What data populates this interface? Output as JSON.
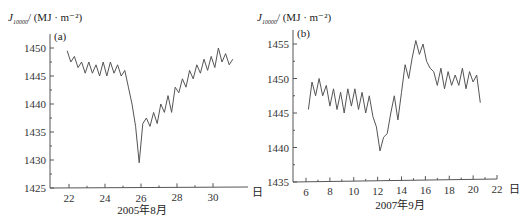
{
  "chart_data": [
    {
      "type": "line",
      "panel": "(a)",
      "ylabel": "J10000/ (MJ · m⁻²)",
      "ylabel_main": "J",
      "ylabel_sub": "10000",
      "ylabel_unit": "/ (MJ · m⁻²)",
      "xlabel": "2005年8月",
      "x_unit": "日",
      "ylim": [
        1425,
        1450
      ],
      "yticks": [
        "1450",
        "1445",
        "1440",
        "1435",
        "1430",
        "1425"
      ],
      "xticks": [
        "22",
        "24",
        "26",
        "28",
        "30"
      ],
      "x": [
        21.9,
        22.1,
        22.3,
        22.5,
        22.7,
        22.9,
        23.1,
        23.3,
        23.5,
        23.7,
        23.9,
        24.1,
        24.3,
        24.5,
        24.7,
        24.9,
        25.1,
        25.3,
        25.5,
        25.7,
        25.9,
        26.1,
        26.3,
        26.5,
        26.7,
        26.9,
        27.1,
        27.3,
        27.5,
        27.7,
        27.9,
        28.1,
        28.3,
        28.5,
        28.7,
        28.9,
        29.1,
        29.3,
        29.5,
        29.7,
        29.9,
        30.1,
        30.3,
        30.5,
        30.7,
        30.9,
        31.1
      ],
      "values": [
        1449.5,
        1447.5,
        1448.5,
        1446.5,
        1447.5,
        1445.5,
        1447.5,
        1445.5,
        1447.0,
        1445.0,
        1447.5,
        1445.0,
        1447.5,
        1445.5,
        1447.0,
        1445.0,
        1446.0,
        1443.0,
        1440.0,
        1436.0,
        1429.5,
        1436.5,
        1437.5,
        1436.0,
        1438.5,
        1436.5,
        1440.0,
        1438.5,
        1441.5,
        1438.5,
        1443.0,
        1442.0,
        1444.5,
        1443.0,
        1446.0,
        1444.5,
        1447.0,
        1445.5,
        1448.0,
        1446.0,
        1448.5,
        1446.5,
        1450.0,
        1447.5,
        1449.0,
        1447.0,
        1448.0
      ]
    },
    {
      "type": "line",
      "panel": "(b)",
      "ylabel": "J10000/ (MJ · m⁻²)",
      "ylabel_main": "J",
      "ylabel_sub": "10000",
      "ylabel_unit": "/ (MJ · m⁻²)",
      "xlabel": "2007年9月",
      "x_unit": "日",
      "ylim": [
        1435,
        1455
      ],
      "yticks": [
        "1455",
        "1450",
        "1445",
        "1440",
        "1435"
      ],
      "xticks": [
        "6",
        "8",
        "10",
        "12",
        "14",
        "16",
        "18",
        "20",
        "22"
      ],
      "x": [
        6.2,
        6.5,
        6.8,
        7.1,
        7.4,
        7.7,
        8.0,
        8.3,
        8.6,
        8.9,
        9.2,
        9.5,
        9.8,
        10.1,
        10.4,
        10.7,
        11.0,
        11.3,
        11.6,
        11.9,
        12.2,
        12.5,
        12.8,
        13.1,
        13.4,
        13.7,
        14.0,
        14.3,
        14.6,
        14.9,
        15.2,
        15.5,
        15.8,
        16.1,
        16.4,
        16.7,
        17.0,
        17.3,
        17.6,
        17.9,
        18.2,
        18.5,
        18.8,
        19.1,
        19.4,
        19.7,
        20.0,
        20.3,
        20.6
      ],
      "values": [
        1445.5,
        1449.5,
        1447.5,
        1450.0,
        1447.5,
        1449.0,
        1446.0,
        1448.5,
        1445.5,
        1448.0,
        1445.0,
        1448.5,
        1446.0,
        1448.5,
        1445.5,
        1448.0,
        1445.0,
        1447.5,
        1444.5,
        1443.0,
        1439.5,
        1441.5,
        1442.0,
        1445.0,
        1447.5,
        1444.0,
        1448.0,
        1452.0,
        1450.0,
        1453.0,
        1455.5,
        1453.5,
        1455.0,
        1452.5,
        1451.5,
        1451.0,
        1449.0,
        1451.5,
        1448.5,
        1451.0,
        1449.0,
        1450.5,
        1449.0,
        1451.5,
        1448.5,
        1451.0,
        1449.5,
        1450.5,
        1446.5
      ]
    }
  ]
}
